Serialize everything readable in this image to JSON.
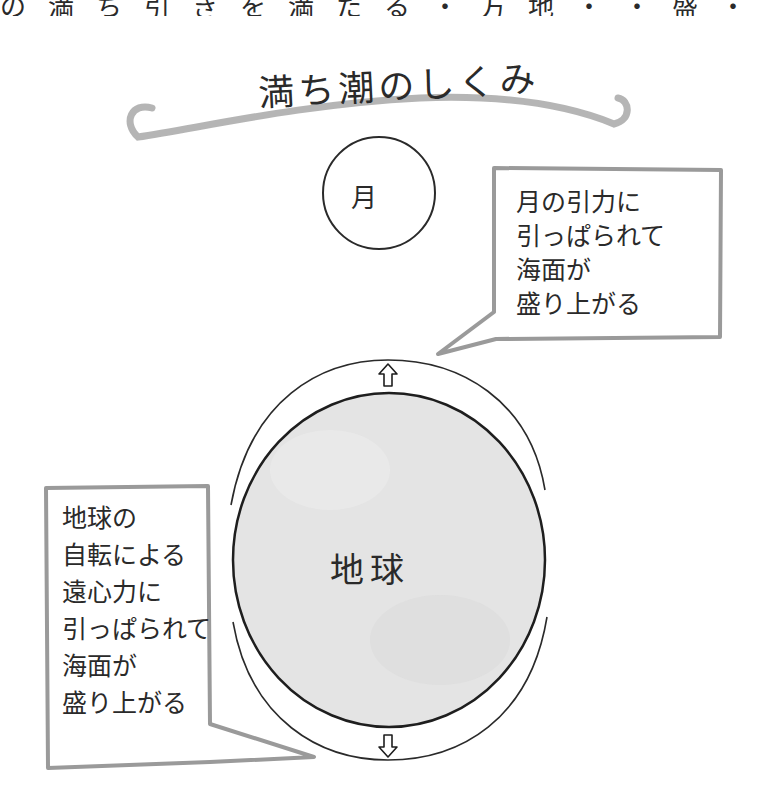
{
  "top_clipped_text": "の満ち引きを満たる・方地・・盛・",
  "title": "満ち潮のしくみ",
  "moon": {
    "label": "月"
  },
  "earth": {
    "label": "地球"
  },
  "bubble_right": {
    "lines": [
      "月の引力に",
      "引っぱられて",
      "海面が",
      "盛り上がる"
    ]
  },
  "bubble_left": {
    "lines": [
      "地球の",
      "自転による",
      "遠心力に",
      "引っぱられて",
      "海面が",
      "盛り上がる"
    ]
  },
  "arrows": {
    "top": "up-arrow",
    "bottom": "down-arrow"
  },
  "colors": {
    "ink": "#1e1e1e",
    "earth_fill": "#e4e4e4",
    "bubble_border": "#9a9a9a",
    "swash": "#a8a8a8"
  }
}
